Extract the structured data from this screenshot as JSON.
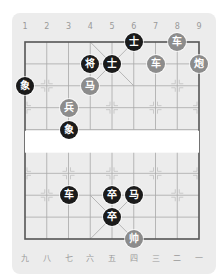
{
  "board": {
    "top_labels": [
      "1",
      "2",
      "3",
      "4",
      "5",
      "6",
      "7",
      "8",
      "9"
    ],
    "bottom_labels": [
      "九",
      "八",
      "七",
      "六",
      "五",
      "四",
      "三",
      "二",
      "一"
    ],
    "colors": {
      "black_piece": "#1b1b1b",
      "red_piece": "#8c8c8c",
      "grid": "#9a9a9a",
      "background": "#ececec"
    }
  },
  "pieces": [
    {
      "char": "士",
      "side": "black",
      "col": 6,
      "row": 0
    },
    {
      "char": "车",
      "side": "red",
      "col": 8,
      "row": 0
    },
    {
      "char": "将",
      "side": "black",
      "col": 4,
      "row": 1
    },
    {
      "char": "士",
      "side": "black",
      "col": 5,
      "row": 1
    },
    {
      "char": "车",
      "side": "red",
      "col": 7,
      "row": 1
    },
    {
      "char": "炮",
      "side": "red",
      "col": 9,
      "row": 1
    },
    {
      "char": "象",
      "side": "black",
      "col": 1,
      "row": 2
    },
    {
      "char": "马",
      "side": "red",
      "col": 4,
      "row": 2
    },
    {
      "char": "兵",
      "side": "red",
      "col": 3,
      "row": 3
    },
    {
      "char": "象",
      "side": "black",
      "col": 3,
      "row": 4
    },
    {
      "char": "车",
      "side": "black",
      "col": 3,
      "row": 7
    },
    {
      "char": "卒",
      "side": "black",
      "col": 5,
      "row": 7
    },
    {
      "char": "马",
      "side": "black",
      "col": 6,
      "row": 7
    },
    {
      "char": "卒",
      "side": "black",
      "col": 5,
      "row": 8
    },
    {
      "char": "帅",
      "side": "red",
      "col": 6,
      "row": 9
    }
  ]
}
